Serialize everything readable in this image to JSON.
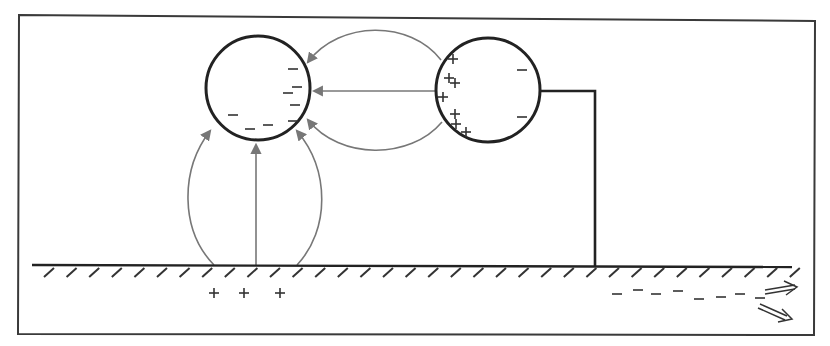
{
  "diagram": {
    "colors": {
      "frame": "#3a3a3a",
      "sphere_outline": "#222222",
      "field_lines": "#777777",
      "charges": "#333333",
      "background": "#ffffff"
    },
    "left_sphere": {
      "center": [
        258,
        88
      ],
      "radius": 52,
      "charges": [
        {
          "sign": "−",
          "x": 293,
          "y": 69
        },
        {
          "sign": "−",
          "x": 297,
          "y": 87
        },
        {
          "sign": "−",
          "x": 288,
          "y": 93
        },
        {
          "sign": "−",
          "x": 295,
          "y": 105
        },
        {
          "sign": "−",
          "x": 233,
          "y": 115
        },
        {
          "sign": "−",
          "x": 268,
          "y": 125
        },
        {
          "sign": "−",
          "x": 293,
          "y": 121
        },
        {
          "sign": "−",
          "x": 250,
          "y": 129
        }
      ]
    },
    "right_sphere": {
      "center": [
        488,
        90
      ],
      "radius": 52,
      "charges": [
        {
          "sign": "+",
          "x": 453,
          "y": 59
        },
        {
          "sign": "+",
          "x": 449,
          "y": 78
        },
        {
          "sign": "+",
          "x": 455,
          "y": 83
        },
        {
          "sign": "+",
          "x": 443,
          "y": 97
        },
        {
          "sign": "+",
          "x": 455,
          "y": 114
        },
        {
          "sign": "+",
          "x": 456,
          "y": 124
        },
        {
          "sign": "+",
          "x": 466,
          "y": 132
        },
        {
          "sign": "−",
          "x": 522,
          "y": 70
        },
        {
          "sign": "−",
          "x": 522,
          "y": 117
        }
      ]
    },
    "ground_charges": [
      {
        "sign": "+",
        "x": 214,
        "y": 293
      },
      {
        "sign": "+",
        "x": 244,
        "y": 293
      },
      {
        "sign": "+",
        "x": 280,
        "y": 293
      }
    ],
    "flowing_charges": [
      {
        "sign": "−",
        "x": 617,
        "y": 294
      },
      {
        "sign": "−",
        "x": 638,
        "y": 290
      },
      {
        "sign": "−",
        "x": 656,
        "y": 294
      },
      {
        "sign": "−",
        "x": 678,
        "y": 291
      },
      {
        "sign": "−",
        "x": 699,
        "y": 299
      },
      {
        "sign": "−",
        "x": 721,
        "y": 297
      },
      {
        "sign": "−",
        "x": 740,
        "y": 294
      },
      {
        "sign": "−",
        "x": 760,
        "y": 298
      }
    ],
    "ground_label": "ground",
    "wire_label": "grounding wire"
  }
}
